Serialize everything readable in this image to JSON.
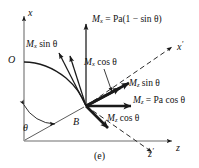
{
  "figure": {
    "caption": "(e)",
    "kind": "free-body-moment-decomposition-diagram",
    "background_color": "#ffffff",
    "line_color": "#1a1a1a",
    "axes": [
      {
        "name": "x",
        "label": "x",
        "style": "solid",
        "direction": "vertical-up"
      },
      {
        "name": "z",
        "label": "z",
        "style": "solid",
        "direction": "horizontal-right"
      },
      {
        "name": "x-prime",
        "label": "x′",
        "style": "dashed",
        "direction": "up-right"
      },
      {
        "name": "z-prime",
        "label": "z′",
        "style": "dashed",
        "direction": "down-right"
      }
    ],
    "points": [
      {
        "name": "O",
        "label": "O"
      },
      {
        "name": "B",
        "label": "B"
      }
    ],
    "angle": {
      "label": "θ",
      "symbol": "theta",
      "between": [
        "x-axis",
        "OB-radius-line"
      ]
    },
    "vectors": [
      {
        "name": "Mx-resultant",
        "label_parts": {
          "symbol": "M",
          "subscript": "x",
          "equals": "=",
          "expression": "Pa(1 − sin θ)"
        },
        "label_text": "Mₓ = Pa(1 − sin θ)",
        "direction": "up",
        "weight": "thin"
      },
      {
        "name": "Mx-sin-theta",
        "label_parts": {
          "symbol": "M",
          "subscript": "x",
          "expression": "sin θ"
        },
        "label_text": "Mₓ sin θ",
        "direction": "up-left",
        "weight": "thin"
      },
      {
        "name": "Mx-cos-theta",
        "label_parts": {
          "symbol": "M",
          "subscript": "x",
          "expression": "cos θ"
        },
        "label_text": "Mₓ cos θ",
        "direction": "up-right-steep",
        "weight": "thick"
      },
      {
        "name": "Mz-sin-theta",
        "label_parts": {
          "symbol": "M",
          "subscript": "z",
          "expression": "sin θ"
        },
        "label_text": "Mᶻ sin θ",
        "direction": "up-right-shallow",
        "weight": "thick"
      },
      {
        "name": "Mz-resultant",
        "label_parts": {
          "symbol": "M",
          "subscript": "z",
          "equals": "=",
          "expression": "Pa cos θ"
        },
        "label_text": "Mᶻ = Pa cos θ",
        "direction": "right",
        "weight": "thick"
      },
      {
        "name": "Mz-cos-theta",
        "label_parts": {
          "symbol": "M",
          "subscript": "z",
          "expression": "cos θ"
        },
        "label_text": "Mᶻ cos θ",
        "direction": "down-right",
        "weight": "thick"
      }
    ],
    "labels": {
      "axis_x": {
        "symbol": "x",
        "prime": ""
      },
      "axis_z": {
        "symbol": "z",
        "prime": ""
      },
      "axis_x_prime": {
        "symbol": "x",
        "prime": "′"
      },
      "axis_z_prime": {
        "symbol": "z",
        "prime": "′"
      },
      "point_o": "O",
      "point_b": "B",
      "theta": "θ",
      "mx_total_symbol": "M",
      "mx_total_sub": "x",
      "mx_total_rest": " = Pa(1 − sin θ)",
      "mx_sin_symbol": "M",
      "mx_sin_sub": "x",
      "mx_sin_rest": " sin θ",
      "mx_cos_symbol": "M",
      "mx_cos_sub": "x",
      "mx_cos_rest": " cos θ",
      "mz_sin_symbol": "M",
      "mz_sin_sub": "z",
      "mz_sin_rest": " sin θ",
      "mz_total_symbol": "M",
      "mz_total_sub": "z",
      "mz_total_rest": " = Pa cos θ",
      "mz_cos_symbol": "M",
      "mz_cos_sub": "z",
      "mz_cos_rest": " cos θ"
    }
  }
}
